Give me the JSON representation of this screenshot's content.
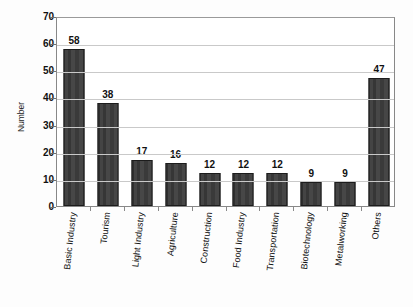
{
  "chart_data": {
    "type": "bar",
    "title": "",
    "subtitle": "",
    "xlabel": "",
    "ylabel": "Number",
    "ylim": [
      0,
      70
    ],
    "ytick_step": 10,
    "yticks": [
      0,
      10,
      20,
      30,
      40,
      50,
      60,
      70
    ],
    "grid": true,
    "legend": false,
    "legend_position": "none",
    "bar_color": "#3d3d3d",
    "bar_border_color": "#1c1c1c",
    "gridline_color": "#c9c9c9",
    "frame_color": "#888888",
    "background_color": "#ffffff",
    "data_labels": true,
    "xtick_label_rotation": -90,
    "categories": [
      "Basic Industry",
      "Tourism",
      "Light Industry",
      "Agriculture",
      "Construction",
      "Food Industry",
      "Transportation",
      "Biotechnology",
      "Metalworking",
      "Others"
    ],
    "values": [
      58,
      38,
      17,
      16,
      12,
      12,
      12,
      9,
      9,
      47
    ],
    "value_labels": [
      "58",
      "38",
      "17",
      "16",
      "12",
      "12",
      "12",
      "9",
      "9",
      "47"
    ]
  }
}
